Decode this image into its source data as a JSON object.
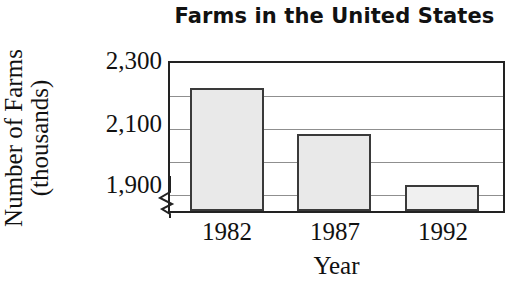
{
  "chart_data": {
    "type": "bar",
    "title": "Farms in the United States",
    "xlabel": "Year",
    "ylabel": "Number of Farms (thousands)",
    "ylabel_line1": "Number of Farms",
    "ylabel_line2": "(thousands)",
    "categories": [
      "1982",
      "1987",
      "1992"
    ],
    "values": [
      2225,
      2085,
      1930
    ],
    "value_unit": "thousands",
    "ylim": [
      1850,
      2300
    ],
    "yticks": [
      1900,
      2100,
      2300
    ],
    "ytick_labels": [
      "1,900",
      "2,100",
      "2,300"
    ],
    "gridlines": [
      1900,
      2000,
      2100,
      2200,
      2300
    ],
    "grid": true,
    "legend": null,
    "axis_break": true,
    "axis_break_note": "y-axis broken below 1,900",
    "series": [
      {
        "name": "Number of Farms (thousands)",
        "values": [
          2225,
          2085,
          1930
        ]
      }
    ],
    "colors": {
      "bar_fill": "#e9e9e9",
      "bar_fill_last": "#f0f0f0",
      "bar_border": "#3a3a3a",
      "frame": "#222222",
      "gridline": "#8f8f8f",
      "text": "#111111",
      "background": "#ffffff"
    }
  }
}
